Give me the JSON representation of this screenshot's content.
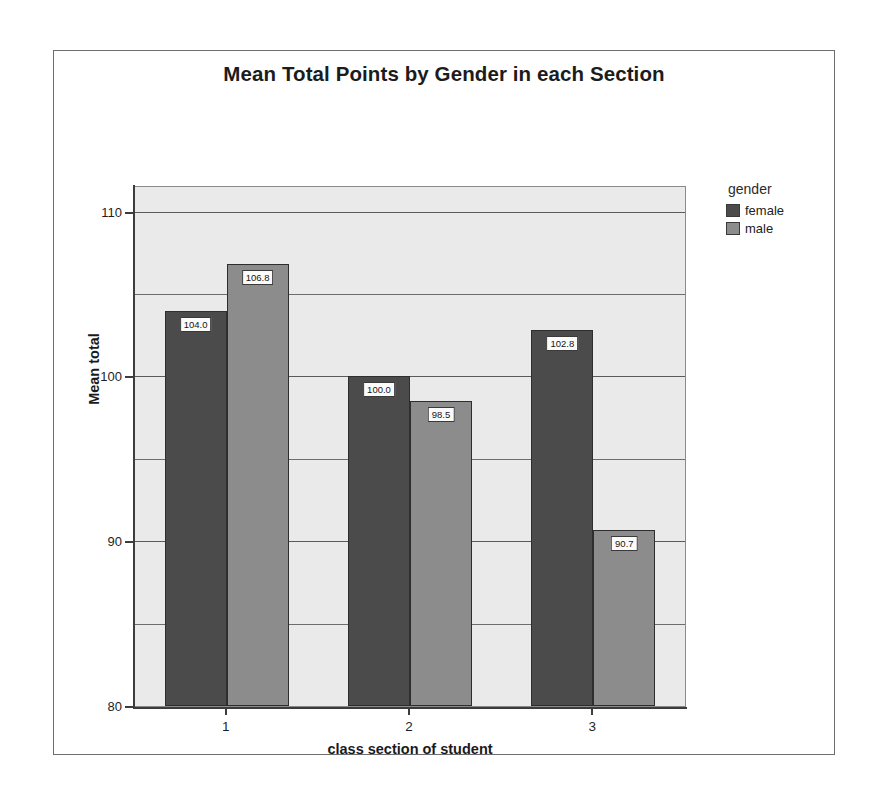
{
  "chart_data": {
    "type": "bar",
    "title": "Mean Total Points by Gender in each Section",
    "xlabel": "class section of student",
    "ylabel": "Mean total",
    "categories": [
      "1",
      "2",
      "3"
    ],
    "series": [
      {
        "name": "female",
        "color": "#4b4b4b",
        "values": [
          104.0,
          100.0,
          102.8
        ],
        "labels": [
          "104.0",
          "100.0",
          "102.8"
        ]
      },
      {
        "name": "male",
        "color": "#8c8c8c",
        "values": [
          106.8,
          98.5,
          90.7
        ],
        "labels": [
          "106.8",
          "98.5",
          "90.7"
        ]
      }
    ],
    "ylim": [
      80,
      111.5
    ],
    "yticks": [
      80,
      90,
      100,
      110
    ],
    "ytick_labels": [
      "80",
      "90",
      "100",
      "110"
    ],
    "minor_gridlines": [
      85,
      95,
      105
    ],
    "grid": true,
    "legend_position": "right",
    "legend_title": "gender",
    "plot_background": "#eaeaea"
  },
  "legend": {
    "title": "gender",
    "items": [
      {
        "label": "female",
        "color": "#4b4b4b"
      },
      {
        "label": "male",
        "color": "#8c8c8c"
      }
    ]
  },
  "axes": {
    "y_title": "Mean total",
    "x_title": "class section of student",
    "y_ticks": [
      "80",
      "90",
      "100",
      "110"
    ],
    "x_ticks": [
      "1",
      "2",
      "3"
    ]
  }
}
